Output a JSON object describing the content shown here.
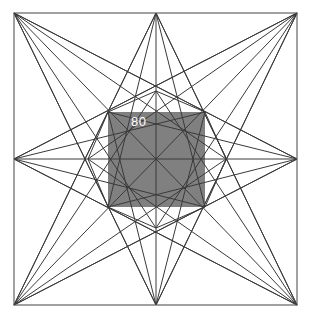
{
  "figure": {
    "background_color": "#ffffff",
    "frame": {
      "name": "outer-square",
      "stroke_color": "#555555",
      "left": 14,
      "top": 13,
      "right": 297,
      "bottom": 305
    },
    "center": {
      "x": 156,
      "y": 159
    },
    "line_color": "#3a3a3a",
    "inner_square": {
      "name": "shaded-center-square",
      "fill_color": "#808080",
      "left": 108,
      "top": 112,
      "right": 205,
      "bottom": 207
    },
    "label": {
      "text": "80",
      "color": "#ffffff",
      "x": 131,
      "y": 126
    },
    "outer_nodes": [
      {
        "name": "corner-top-left",
        "x": 14,
        "y": 13
      },
      {
        "name": "edge-top-mid",
        "x": 156,
        "y": 13
      },
      {
        "name": "corner-top-right",
        "x": 297,
        "y": 13
      },
      {
        "name": "edge-right-mid",
        "x": 297,
        "y": 159
      },
      {
        "name": "corner-bottom-right",
        "x": 297,
        "y": 305
      },
      {
        "name": "edge-bottom-mid",
        "x": 156,
        "y": 305
      },
      {
        "name": "corner-bottom-left",
        "x": 14,
        "y": 305
      },
      {
        "name": "edge-left-mid",
        "x": 14,
        "y": 159
      }
    ],
    "inner_nodes": [
      {
        "name": "inner-top-left",
        "x": 108,
        "y": 112
      },
      {
        "name": "inner-top-mid",
        "x": 156,
        "y": 91
      },
      {
        "name": "inner-top-right",
        "x": 205,
        "y": 112
      },
      {
        "name": "inner-right-mid",
        "x": 226,
        "y": 159
      },
      {
        "name": "inner-bottom-right",
        "x": 205,
        "y": 207
      },
      {
        "name": "inner-bottom-mid",
        "x": 156,
        "y": 228
      },
      {
        "name": "inner-bottom-left",
        "x": 108,
        "y": 207
      },
      {
        "name": "inner-left-mid",
        "x": 88,
        "y": 159
      }
    ],
    "star_chords": [
      {
        "name": "chord-0",
        "from": 0,
        "to": 3
      },
      {
        "name": "chord-1",
        "from": 1,
        "to": 4
      },
      {
        "name": "chord-2",
        "from": 2,
        "to": 5
      },
      {
        "name": "chord-3",
        "from": 3,
        "to": 6
      },
      {
        "name": "chord-4",
        "from": 4,
        "to": 7
      },
      {
        "name": "chord-5",
        "from": 5,
        "to": 0
      },
      {
        "name": "chord-6",
        "from": 6,
        "to": 1
      },
      {
        "name": "chord-7",
        "from": 7,
        "to": 2
      }
    ],
    "star_chords_b": [
      {
        "name": "chordb-0",
        "from": 0,
        "to": 5
      },
      {
        "name": "chordb-1",
        "from": 1,
        "to": 6
      },
      {
        "name": "chordb-2",
        "from": 2,
        "to": 7
      },
      {
        "name": "chordb-3",
        "from": 3,
        "to": 0
      },
      {
        "name": "chordb-4",
        "from": 4,
        "to": 1
      },
      {
        "name": "chordb-5",
        "from": 5,
        "to": 2
      },
      {
        "name": "chordb-6",
        "from": 6,
        "to": 3
      },
      {
        "name": "chordb-7",
        "from": 7,
        "to": 4
      }
    ],
    "spokes": [
      {
        "name": "spoke-to-top-left"
      },
      {
        "name": "spoke-to-top"
      },
      {
        "name": "spoke-to-top-right"
      },
      {
        "name": "spoke-to-right"
      },
      {
        "name": "spoke-to-bottom-right"
      },
      {
        "name": "spoke-to-bottom"
      },
      {
        "name": "spoke-to-bottom-left"
      },
      {
        "name": "spoke-to-left"
      }
    ]
  },
  "chart_data": {
    "type": "diagram",
    "title": "",
    "annotations": [
      "80"
    ],
    "values": [
      80
    ],
    "series": [
      {
        "name": "inner-square-side-label",
        "values": [
          80
        ]
      }
    ],
    "xlabel": "",
    "ylabel": ""
  }
}
